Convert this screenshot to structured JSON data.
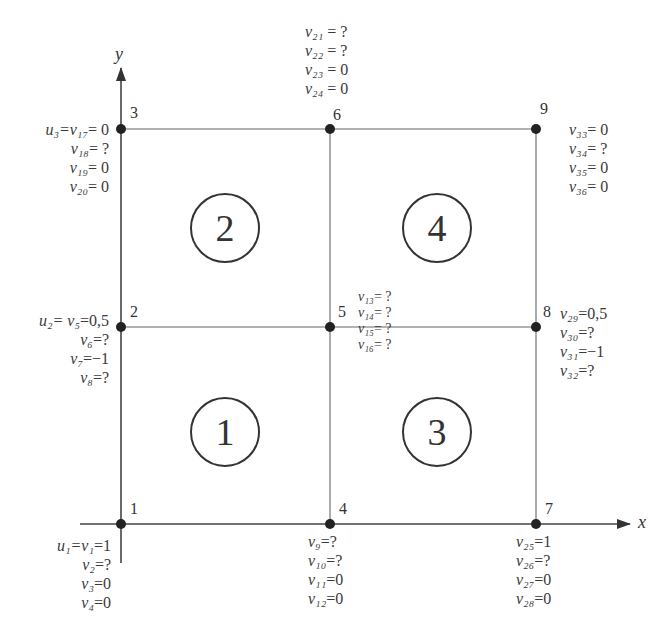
{
  "axes": {
    "x_label": "x",
    "y_label": "y"
  },
  "elements": [
    {
      "id": "1",
      "label": "1",
      "cx": 225,
      "cy": 432
    },
    {
      "id": "2",
      "label": "2",
      "cx": 225,
      "cy": 228
    },
    {
      "id": "3",
      "label": "3",
      "cx": 437,
      "cy": 432
    },
    {
      "id": "4",
      "label": "4",
      "cx": 437,
      "cy": 228
    }
  ],
  "nodes": [
    {
      "id": "1",
      "x": 121,
      "y": 524
    },
    {
      "id": "2",
      "x": 121,
      "y": 327
    },
    {
      "id": "3",
      "x": 121,
      "y": 129
    },
    {
      "id": "4",
      "x": 330,
      "y": 524
    },
    {
      "id": "5",
      "x": 330,
      "y": 327
    },
    {
      "id": "6",
      "x": 330,
      "y": 129
    },
    {
      "id": "7",
      "x": 536,
      "y": 524
    },
    {
      "id": "8",
      "x": 536,
      "y": 327
    },
    {
      "id": "9",
      "x": 536,
      "y": 129
    }
  ],
  "conditions": {
    "node1": [
      {
        "lhs": "u₁=v₁",
        "rhs": "=1"
      },
      {
        "lhs": "v₂",
        "rhs": "=?"
      },
      {
        "lhs": "v₃",
        "rhs": "=0"
      },
      {
        "lhs": "v₄",
        "rhs": "=0"
      }
    ],
    "node2": [
      {
        "lhs": "u₂= v₅",
        "rhs": "=0,5"
      },
      {
        "lhs": "v₆",
        "rhs": "=?"
      },
      {
        "lhs": "v₇",
        "rhs": "=−1"
      },
      {
        "lhs": "v₈",
        "rhs": "=?"
      }
    ],
    "node3": [
      {
        "lhs": "u₃=v₁₇",
        "rhs": "= 0"
      },
      {
        "lhs": "v₁₈",
        "rhs": "= ?"
      },
      {
        "lhs": "v₁₉",
        "rhs": "= 0"
      },
      {
        "lhs": "v₂₀",
        "rhs": "= 0"
      }
    ],
    "node4": [
      {
        "lhs": "v₉",
        "rhs": "=?"
      },
      {
        "lhs": "v₁₀",
        "rhs": "=?"
      },
      {
        "lhs": "v₁₁",
        "rhs": "=0"
      },
      {
        "lhs": "v₁₂",
        "rhs": "=0"
      }
    ],
    "node5": [
      {
        "lhs": "v₁₃",
        "rhs": "= ?"
      },
      {
        "lhs": "v₁₄",
        "rhs": "= ?"
      },
      {
        "lhs": "v₁₅",
        "rhs": "= ?"
      },
      {
        "lhs": "v₁₆",
        "rhs": "= ?"
      }
    ],
    "node6": [
      {
        "lhs": "v₂₁",
        "rhs": " = ?"
      },
      {
        "lhs": "v₂₂",
        "rhs": " = ?"
      },
      {
        "lhs": "v₂₃",
        "rhs": " = 0"
      },
      {
        "lhs": "v₂₄",
        "rhs": " = 0"
      }
    ],
    "node7": [
      {
        "lhs": "v₂₅",
        "rhs": "=1"
      },
      {
        "lhs": "v₂₆",
        "rhs": "=?"
      },
      {
        "lhs": "v₂₇",
        "rhs": "=0"
      },
      {
        "lhs": "v₂₈",
        "rhs": "=0"
      }
    ],
    "node8": [
      {
        "lhs": "v₂₉",
        "rhs": "=0,5"
      },
      {
        "lhs": "v₃₀",
        "rhs": "=?"
      },
      {
        "lhs": "v₃₁",
        "rhs": "=−1"
      },
      {
        "lhs": "v₃₂",
        "rhs": "=?"
      }
    ],
    "node9": [
      {
        "lhs": "v₃₃",
        "rhs": "= 0"
      },
      {
        "lhs": "v₃₄",
        "rhs": "= ?"
      },
      {
        "lhs": "v₃₅",
        "rhs": "= 0"
      },
      {
        "lhs": "v₃₆",
        "rhs": "= 0"
      }
    ]
  },
  "colors": {
    "line": "#555555",
    "node": "#222222",
    "text": "#3a3a3a"
  }
}
